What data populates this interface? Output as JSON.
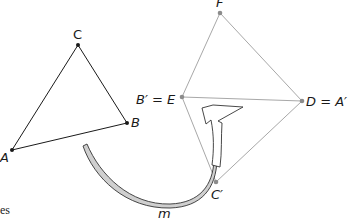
{
  "diagram": {
    "original_triangle": {
      "vertices": [
        {
          "name": "A",
          "label": "A",
          "x": 12,
          "y": 150
        },
        {
          "name": "B",
          "label": "B",
          "x": 127,
          "y": 123
        },
        {
          "name": "C",
          "label": "C",
          "x": 78,
          "y": 45
        }
      ],
      "stroke": "#1a1a1a"
    },
    "image_figure": {
      "vertices": [
        {
          "name": "F",
          "label": "F",
          "x": 220,
          "y": 13
        },
        {
          "name": "E",
          "label": "B′ = E",
          "x": 182,
          "y": 97
        },
        {
          "name": "D",
          "label": "D = A′",
          "x": 302,
          "y": 101
        },
        {
          "name": "C_prime",
          "label": "C′",
          "x": 216,
          "y": 182
        }
      ],
      "stroke": "#a8a8a8",
      "point_color": "#8c8c8c"
    },
    "transformation_arrow": {
      "label": "m",
      "fill": "#cfcfcf",
      "stroke": "#333333"
    },
    "caption_fragment": "es"
  }
}
